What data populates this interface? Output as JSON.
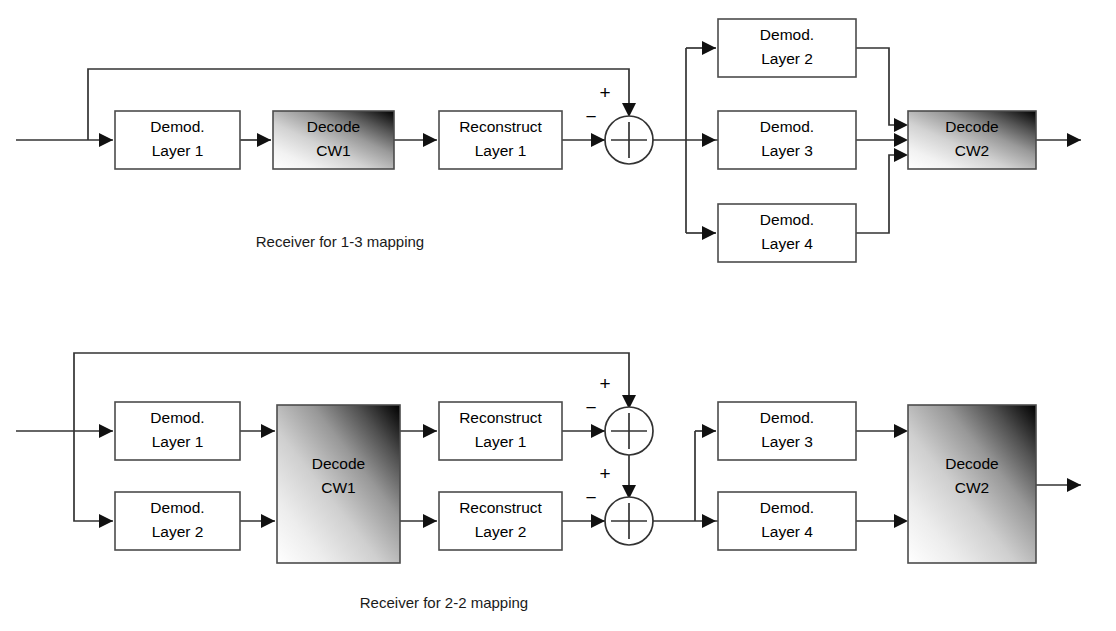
{
  "figure": {
    "background_color": "#ffffff",
    "line_color": "#333333",
    "box_stroke_color": "#4c4c4c",
    "box_fill_color": "#ffffff"
  },
  "diagrams": [
    {
      "id": "receiver-1-3",
      "caption": "Receiver for 1-3 mapping",
      "blocks": [
        {
          "key": "d1",
          "line1": "Demod.",
          "line2": "Layer 1",
          "style": "plain"
        },
        {
          "key": "cw1",
          "line1": "Decode",
          "line2": "CW1",
          "style": "gradient"
        },
        {
          "key": "r1",
          "line1": "Reconstruct",
          "line2": "Layer 1",
          "style": "plain"
        },
        {
          "key": "d2",
          "line1": "Demod.",
          "line2": "Layer 2",
          "style": "plain"
        },
        {
          "key": "d3",
          "line1": "Demod.",
          "line2": "Layer 3",
          "style": "plain"
        },
        {
          "key": "d4",
          "line1": "Demod.",
          "line2": "Layer 4",
          "style": "plain"
        },
        {
          "key": "cw2",
          "line1": "Decode",
          "line2": "CW2",
          "style": "gradient"
        }
      ],
      "summers": [
        {
          "key": "sum1",
          "plus": "+",
          "minus": "−"
        }
      ]
    },
    {
      "id": "receiver-2-2",
      "caption": "Receiver for 2-2 mapping",
      "blocks": [
        {
          "key": "d1",
          "line1": "Demod.",
          "line2": "Layer 1",
          "style": "plain"
        },
        {
          "key": "d2",
          "line1": "Demod.",
          "line2": "Layer 2",
          "style": "plain"
        },
        {
          "key": "cw1",
          "line1": "Decode",
          "line2": "CW1",
          "style": "gradient"
        },
        {
          "key": "r1",
          "line1": "Reconstruct",
          "line2": "Layer 1",
          "style": "plain"
        },
        {
          "key": "r2",
          "line1": "Reconstruct",
          "line2": "Layer 2",
          "style": "plain"
        },
        {
          "key": "d3",
          "line1": "Demod.",
          "line2": "Layer 3",
          "style": "plain"
        },
        {
          "key": "d4",
          "line1": "Demod.",
          "line2": "Layer 4",
          "style": "plain"
        },
        {
          "key": "cw2",
          "line1": "Decode",
          "line2": "CW2",
          "style": "gradient"
        }
      ],
      "summers": [
        {
          "key": "sum1",
          "plus": "+",
          "minus": "−"
        },
        {
          "key": "sum2",
          "plus": "+",
          "minus": "−"
        }
      ]
    }
  ]
}
